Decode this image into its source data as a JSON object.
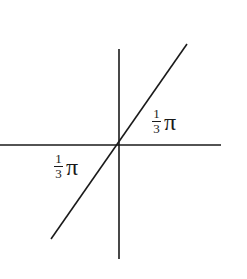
{
  "diagram": {
    "type": "angle-diagram",
    "lines": {
      "horizontal_axis": {
        "x1": 0,
        "y1": 145,
        "x2": 221,
        "y2": 145
      },
      "vertical_axis": {
        "x1": 119,
        "y1": 49,
        "x2": 119,
        "y2": 259
      },
      "oblique_line": {
        "x1": 51,
        "y1": 239,
        "x2": 187,
        "y2": 44
      }
    },
    "labels": [
      {
        "numerator": "1",
        "denominator": "3",
        "symbol": "π",
        "position": "upper-right"
      },
      {
        "numerator": "1",
        "denominator": "3",
        "symbol": "π",
        "position": "lower-left"
      }
    ],
    "stroke_color": "#1a1a1a"
  }
}
